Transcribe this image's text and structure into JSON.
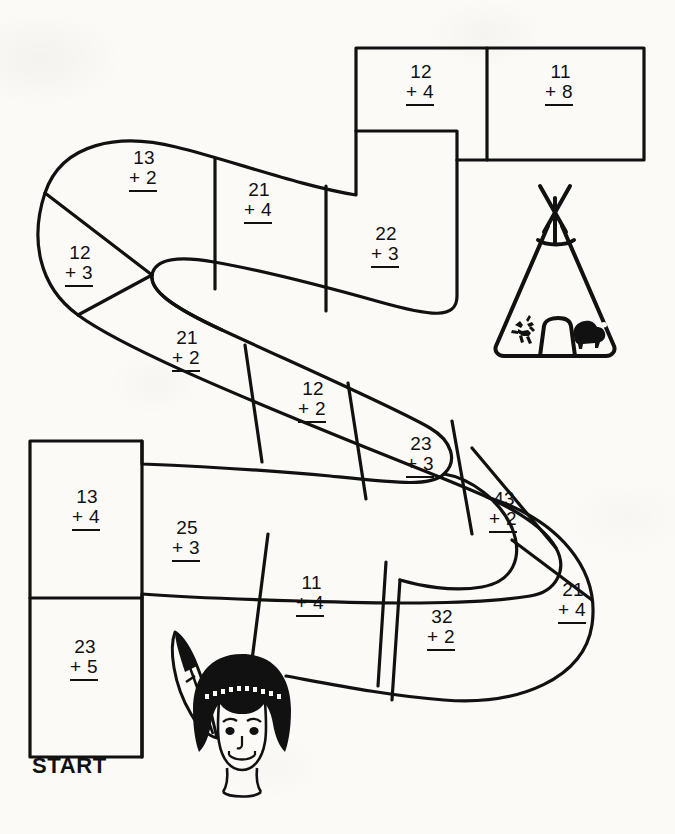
{
  "worksheet": {
    "title": "Addition Path Game Board",
    "start_label": "START",
    "ink_color": "#111111",
    "paper_color": "#fbfaf7"
  },
  "path": {
    "cells": [
      {
        "id": "start",
        "top": "23",
        "op": "+",
        "bottom": "5",
        "x": 70,
        "y": 637
      },
      {
        "id": "c1",
        "top": "13",
        "op": "+",
        "bottom": "4",
        "x": 72,
        "y": 487
      },
      {
        "id": "c2",
        "top": "25",
        "op": "+",
        "bottom": "3",
        "x": 172,
        "y": 518
      },
      {
        "id": "c3",
        "top": "11",
        "op": "+",
        "bottom": "4",
        "x": 296,
        "y": 573
      },
      {
        "id": "c4",
        "top": "32",
        "op": "+",
        "bottom": "2",
        "x": 427,
        "y": 607
      },
      {
        "id": "c5",
        "top": "21",
        "op": "+",
        "bottom": "4",
        "x": 558,
        "y": 580
      },
      {
        "id": "c6",
        "top": "43",
        "op": "+",
        "bottom": "2",
        "x": 489,
        "y": 489
      },
      {
        "id": "c7",
        "top": "23",
        "op": "+",
        "bottom": "3",
        "x": 406,
        "y": 434
      },
      {
        "id": "c8",
        "top": "12",
        "op": "+",
        "bottom": "2",
        "x": 298,
        "y": 379
      },
      {
        "id": "c9",
        "top": "21",
        "op": "+",
        "bottom": "2",
        "x": 172,
        "y": 328
      },
      {
        "id": "c10",
        "top": "12",
        "op": "+",
        "bottom": "3",
        "x": 65,
        "y": 243
      },
      {
        "id": "c11",
        "top": "13",
        "op": "+",
        "bottom": "2",
        "x": 129,
        "y": 148
      },
      {
        "id": "c12",
        "top": "21",
        "op": "+",
        "bottom": "4",
        "x": 244,
        "y": 180
      },
      {
        "id": "c13",
        "top": "22",
        "op": "+",
        "bottom": "3",
        "x": 371,
        "y": 224
      },
      {
        "id": "c14",
        "top": "12",
        "op": "+",
        "bottom": "4",
        "x": 406,
        "y": 62
      },
      {
        "id": "c15",
        "top": "11",
        "op": "+",
        "bottom": "8",
        "x": 545,
        "y": 62
      }
    ]
  },
  "illustrations": {
    "teepee": {
      "name": "teepee",
      "motif_left": "horse-rider",
      "motif_right": "buffalo"
    },
    "child": {
      "name": "child-with-feather-headband"
    }
  }
}
